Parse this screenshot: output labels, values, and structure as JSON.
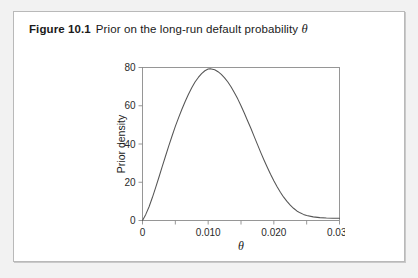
{
  "figure": {
    "caption_label": "Figure 10.1",
    "caption_text": "Prior on the long-run default probability",
    "caption_symbol": "θ"
  },
  "chart_data": {
    "type": "line",
    "title": "Prior on the long-run default probability θ",
    "xlabel": "θ",
    "ylabel": "Prior density",
    "xlim": [
      0,
      0.03
    ],
    "ylim": [
      0,
      80
    ],
    "grid": false,
    "legend": false,
    "xticks": [
      0,
      0.005,
      0.01,
      0.015,
      0.02,
      0.025,
      0.03
    ],
    "xtick_labels": [
      "0",
      "",
      "0.010",
      "",
      "0.020",
      "",
      "0.030"
    ],
    "yticks": [
      0,
      20,
      40,
      60,
      80
    ],
    "ytick_labels": [
      "0",
      "20",
      "40",
      "60",
      "80"
    ],
    "series": [
      {
        "name": "Prior density",
        "color": "#555555",
        "x": [
          0.0,
          0.0005,
          0.001,
          0.0015,
          0.002,
          0.0025,
          0.003,
          0.0035,
          0.004,
          0.0045,
          0.005,
          0.0055,
          0.006,
          0.0065,
          0.007,
          0.0075,
          0.008,
          0.0085,
          0.009,
          0.0095,
          0.01,
          0.0103,
          0.011,
          0.0115,
          0.012,
          0.0125,
          0.013,
          0.0135,
          0.014,
          0.0145,
          0.015,
          0.0155,
          0.016,
          0.0165,
          0.017,
          0.0175,
          0.018,
          0.0185,
          0.019,
          0.0195,
          0.02,
          0.0205,
          0.021,
          0.0215,
          0.022,
          0.0225,
          0.023,
          0.0235,
          0.024,
          0.0245,
          0.025,
          0.026,
          0.027,
          0.028,
          0.029,
          0.03
        ],
        "y": [
          0.0,
          3.2,
          7.2,
          12.0,
          17.2,
          22.6,
          28.2,
          33.6,
          39.0,
          44.2,
          49.2,
          53.8,
          58.2,
          62.2,
          66.0,
          69.4,
          72.4,
          74.8,
          76.8,
          78.3,
          79.2,
          79.4,
          78.8,
          77.8,
          76.4,
          74.6,
          72.4,
          69.8,
          66.8,
          63.6,
          60.0,
          56.2,
          52.2,
          48.2,
          44.0,
          39.8,
          35.6,
          31.6,
          27.8,
          24.2,
          20.8,
          17.6,
          14.8,
          12.2,
          10.0,
          8.0,
          6.4,
          5.0,
          4.0,
          3.2,
          2.6,
          1.9,
          1.5,
          1.3,
          1.2,
          1.2
        ]
      }
    ],
    "annotations": {
      "peak_x": 0.0103,
      "peak_y": 79.4
    }
  }
}
